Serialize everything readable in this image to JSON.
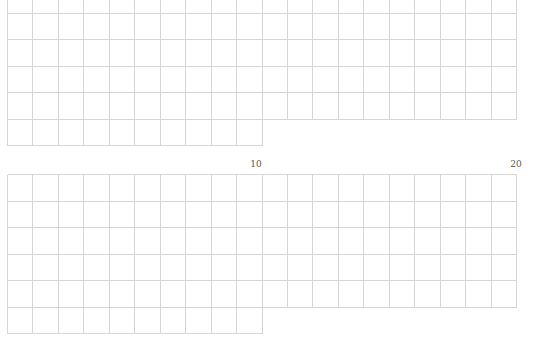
{
  "diagram": {
    "type": "ten-frame-grids",
    "line_color": "#d6d6d6",
    "panels": [
      {
        "name": "upper-grid",
        "full_columns": 20,
        "rows_full_width": 5,
        "extra_row_columns": 10,
        "labels": []
      },
      {
        "name": "lower-grid",
        "full_columns": 20,
        "rows_full_width": 5,
        "extra_row_columns": 10,
        "labels": [
          {
            "text": "10",
            "column_index": 10
          },
          {
            "text": "20",
            "column_index": 20
          }
        ]
      }
    ]
  },
  "labels": {
    "lower_ten": "10",
    "lower_twenty": "20"
  }
}
